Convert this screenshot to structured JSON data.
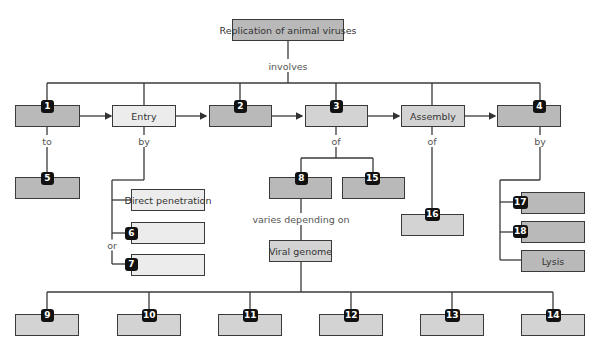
{
  "diagram": {
    "root": "Replication of animal viruses",
    "root_link": "involves",
    "stages": [
      {
        "id": "1",
        "label": ""
      },
      {
        "id": "",
        "label": "Entry"
      },
      {
        "id": "2",
        "label": ""
      },
      {
        "id": "3",
        "label": ""
      },
      {
        "id": "",
        "label": "Assembly"
      },
      {
        "id": "4",
        "label": ""
      }
    ],
    "links": {
      "s1_to": "to",
      "entry_by": "by",
      "s3_of": "of",
      "assembly_of": "of",
      "s4_by": "by",
      "entry_or": "or",
      "s8_varies": "varies depending on"
    },
    "node5": {
      "id": "5",
      "label": ""
    },
    "entry_methods": [
      {
        "id": "",
        "label": "Direct penetration"
      },
      {
        "id": "6",
        "label": ""
      },
      {
        "id": "7",
        "label": ""
      }
    ],
    "s3_children": [
      {
        "id": "8",
        "label": ""
      },
      {
        "id": "15",
        "label": ""
      }
    ],
    "node16": {
      "id": "16",
      "label": ""
    },
    "release_methods": [
      {
        "id": "17",
        "label": ""
      },
      {
        "id": "18",
        "label": ""
      },
      {
        "id": "",
        "label": "Lysis"
      }
    ],
    "viral_genome": "Viral genome",
    "genome_types": [
      {
        "id": "9",
        "label": ""
      },
      {
        "id": "10",
        "label": ""
      },
      {
        "id": "11",
        "label": ""
      },
      {
        "id": "12",
        "label": ""
      },
      {
        "id": "13",
        "label": ""
      },
      {
        "id": "14",
        "label": ""
      }
    ]
  },
  "colors": {
    "dark_fill": "#b9b9b9",
    "mid_fill": "#d3d3d3",
    "light_fill": "#ececec",
    "border": "#3a3a3a",
    "badge": "#111111"
  }
}
